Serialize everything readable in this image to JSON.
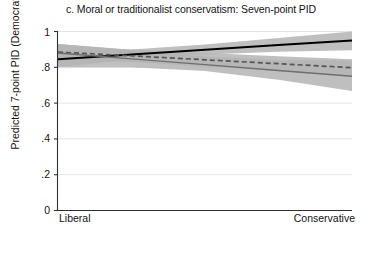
{
  "chart_data": {
    "type": "line",
    "title": "c. Moral or traditionalist conservatism: Seven-point PID",
    "xlabel": "Moral liberal/conservative scale",
    "ylabel": "Predicted 7-point PID (Democrat = 1)",
    "xlim": [
      0,
      1
    ],
    "ylim": [
      0,
      1
    ],
    "grid": true,
    "legend": "none",
    "xtick_labels": [
      "Liberal",
      "Conservative"
    ],
    "xtick_values": [
      0,
      1
    ],
    "ytick_labels": [
      "0",
      ".2",
      ".4",
      ".6",
      ".8",
      "1"
    ],
    "ytick_values": [
      0,
      0.2,
      0.4,
      0.6,
      0.8,
      1
    ],
    "x": [
      0,
      0.25,
      0.5,
      0.75,
      1
    ],
    "series": [
      {
        "name": "solid-black",
        "style": "solid",
        "color": "#000000",
        "values": [
          0.845,
          0.872,
          0.898,
          0.924,
          0.95
        ],
        "ci_lower": [
          0.8,
          0.845,
          0.872,
          0.887,
          0.895
        ],
        "ci_upper": [
          0.892,
          0.9,
          0.927,
          0.963,
          1.0
        ],
        "ci_color": "#b4b4b4"
      },
      {
        "name": "dashed-gray",
        "style": "dashed",
        "color": "#555555",
        "values": [
          0.885,
          0.864,
          0.842,
          0.82,
          0.798
        ],
        "ci_lower": [
          0.84,
          0.83,
          0.805,
          0.778,
          0.752
        ],
        "ci_upper": [
          0.93,
          0.898,
          0.88,
          0.862,
          0.845
        ],
        "ci_color": "#b4b4b4"
      },
      {
        "name": "solid-gray",
        "style": "solid",
        "color": "#6e6e6e",
        "values": [
          0.88,
          0.847,
          0.815,
          0.782,
          0.75
        ],
        "ci_lower": [
          0.8,
          0.8,
          0.78,
          0.73,
          0.668
        ],
        "ci_upper": [
          0.93,
          0.896,
          0.86,
          0.84,
          0.838
        ],
        "ci_color": "#b4b4b4"
      }
    ]
  }
}
